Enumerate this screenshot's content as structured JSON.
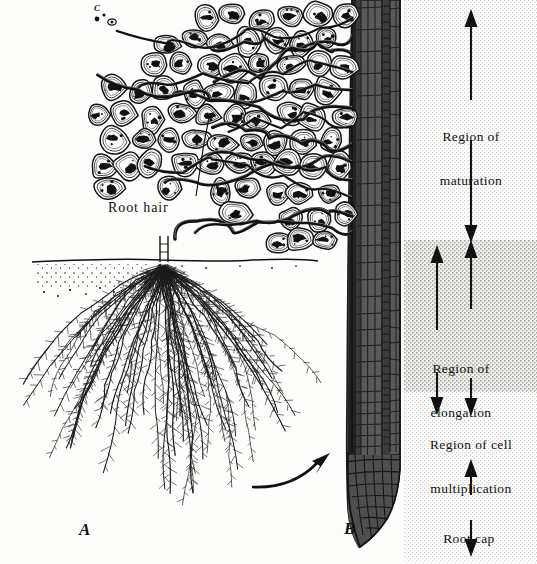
{
  "figure": {
    "panels": [
      {
        "id": "A",
        "label": "A",
        "caption": "Fibrous root system in soil"
      },
      {
        "id": "B",
        "label": "B",
        "caption": "Longitudinal section of root tip"
      },
      {
        "id": "C",
        "label": "C",
        "caption": "Root hairs among soil particles"
      }
    ]
  },
  "callouts": {
    "root_hair": "Root hair"
  },
  "regions": [
    {
      "key": "maturation",
      "line1": "Region of",
      "line2": "maturation",
      "arrow": "double",
      "shading": "light"
    },
    {
      "key": "elongation",
      "line1": "Region of",
      "line2": "elongation",
      "arrow": "double",
      "shading": "dark"
    },
    {
      "key": "cell_multiplication",
      "line1": "Region of cell",
      "line2": "multiplication",
      "arrow": "double",
      "shading": "light"
    },
    {
      "key": "root_cap",
      "line1": "Root cap",
      "line2": "",
      "arrow": "double",
      "shading": "light"
    }
  ],
  "colors": {
    "ink": "#111111",
    "paper": "#fdfdfb",
    "stipple_light": "#f2f2f0",
    "stipple_dark": "#dcdcda",
    "root_tissue": "#4a4a4a",
    "root_tissue_dark": "#2a2a2a"
  }
}
